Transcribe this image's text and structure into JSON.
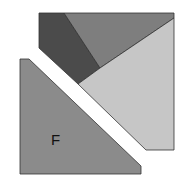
{
  "diagram": {
    "pieces": [
      {
        "id": "dark-piece",
        "color": "#4b4b4b",
        "points": "39,13 64,13 100,68 78,84 39,48"
      },
      {
        "id": "medium-piece",
        "color": "#7e7e7e",
        "points": "64,13 174,13 174,18 100,68"
      },
      {
        "id": "light-piece",
        "color": "#c6c6c6",
        "points": "174,18 174,150 146,150 78,84 100,68"
      },
      {
        "id": "f-piece",
        "color": "#8b8b8b",
        "points": "20,59 29,59 141,166 141,174 20,174"
      }
    ],
    "labels": [
      {
        "id": "f-label",
        "text": "F",
        "x": 51,
        "y": 145
      }
    ],
    "stroke_color": "#333333"
  }
}
